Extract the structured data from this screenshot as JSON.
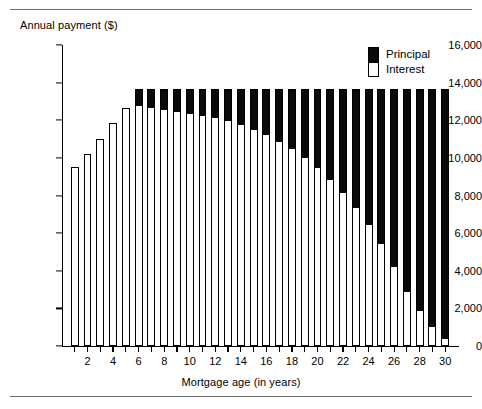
{
  "figure": {
    "y_axis_title": "Annual payment ($)",
    "x_axis_title": "Mortgage age (in years)"
  },
  "legend": {
    "principal_label": "Principal",
    "interest_label": "Interest",
    "principal_color": "#0a0a0a",
    "interest_color": "#ffffff"
  },
  "chart_data": {
    "type": "bar",
    "subtype": "stacked",
    "title": "",
    "xlabel": "Mortgage age (in years)",
    "ylabel": "Annual payment ($)",
    "xlim": [
      0,
      31
    ],
    "ylim": [
      0,
      16000
    ],
    "ytick_labels": [
      "0",
      "2,000",
      "4,000",
      "6,000",
      "8,000",
      "10,000",
      "12,000",
      "14,000",
      "16,000"
    ],
    "ytick_values": [
      0,
      2000,
      4000,
      6000,
      8000,
      10000,
      12000,
      14000,
      16000
    ],
    "xtick_values": [
      2,
      4,
      6,
      8,
      10,
      12,
      14,
      16,
      18,
      20,
      22,
      24,
      26,
      28,
      30
    ],
    "xtick_labels": [
      "2",
      "4",
      "6",
      "8",
      "10",
      "12",
      "14",
      "16",
      "18",
      "20",
      "22",
      "24",
      "26",
      "28",
      "30"
    ],
    "grid": false,
    "legend_position": "top-right",
    "categories": [
      1,
      2,
      3,
      4,
      5,
      6,
      7,
      8,
      9,
      10,
      11,
      12,
      13,
      14,
      15,
      16,
      17,
      18,
      19,
      20,
      21,
      22,
      23,
      24,
      25,
      26,
      27,
      28,
      29,
      30
    ],
    "series": [
      {
        "name": "Interest",
        "color": "#ffffff",
        "values": [
          9500,
          10200,
          11000,
          11850,
          12650,
          12800,
          12700,
          12600,
          12500,
          12400,
          12300,
          12150,
          12000,
          11800,
          11550,
          11250,
          10900,
          10500,
          10050,
          9500,
          8900,
          8200,
          7400,
          6500,
          5450,
          4250,
          2950,
          1900,
          1050,
          400
        ]
      },
      {
        "name": "Principal",
        "color": "#0a0a0a",
        "values": [
          0,
          0,
          0,
          0,
          0,
          850,
          950,
          1050,
          1150,
          1250,
          1350,
          1500,
          1650,
          1850,
          2100,
          2400,
          2750,
          3150,
          3600,
          4150,
          4750,
          5450,
          6250,
          7150,
          8200,
          9400,
          10700,
          11750,
          12600,
          13250
        ]
      }
    ],
    "totals": [
      9500,
      10200,
      11000,
      11850,
      12650,
      13650,
      13650,
      13650,
      13650,
      13650,
      13650,
      13650,
      13650,
      13650,
      13650,
      13650,
      13650,
      13650,
      13650,
      13650,
      13650,
      13650,
      13650,
      13650,
      13650,
      13650,
      13650,
      13650,
      13650,
      13650
    ]
  }
}
